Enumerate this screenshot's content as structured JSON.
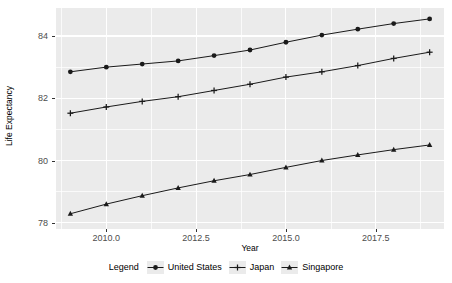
{
  "chart_data": {
    "type": "line",
    "title": "",
    "xlabel": "Year",
    "ylabel": "Life Expectancy",
    "x": [
      2009,
      2010,
      2011,
      2012,
      2013,
      2014,
      2015,
      2016,
      2017,
      2018,
      2019
    ],
    "xlim": [
      2008.6,
      2019.4
    ],
    "ylim": [
      77.8,
      84.9
    ],
    "xticks": [
      2010.0,
      2012.5,
      2015.0,
      2017.5
    ],
    "xtick_labels": [
      "2010.0",
      "2012.5",
      "2015.0",
      "2017.5"
    ],
    "yticks": [
      78,
      80,
      82,
      84
    ],
    "ytick_labels": [
      "78",
      "80",
      "82",
      "84"
    ],
    "x_minor_ticks": [
      2008.75,
      2011.25,
      2013.75,
      2016.25,
      2018.75
    ],
    "y_minor_ticks": [
      79,
      81,
      83
    ],
    "grid": true,
    "legend_position": "bottom",
    "legend_title": "Legend",
    "series": [
      {
        "name": "United States",
        "marker": "circle",
        "color": "#1a1a1a",
        "values": [
          82.85,
          83.0,
          83.1,
          83.2,
          83.37,
          83.55,
          83.8,
          84.03,
          84.22,
          84.4,
          84.55
        ]
      },
      {
        "name": "Japan",
        "marker": "plus",
        "color": "#1a1a1a",
        "values": [
          81.52,
          81.72,
          81.9,
          82.05,
          82.25,
          82.45,
          82.68,
          82.85,
          83.05,
          83.28,
          83.48
        ]
      },
      {
        "name": "Singapore",
        "marker": "triangle",
        "color": "#1a1a1a",
        "values": [
          78.29,
          78.6,
          78.87,
          79.12,
          79.35,
          79.55,
          79.78,
          80.0,
          80.18,
          80.35,
          80.5
        ]
      }
    ]
  },
  "panel": {
    "background_color": "#ebebeb",
    "grid_color": "#ffffff"
  }
}
